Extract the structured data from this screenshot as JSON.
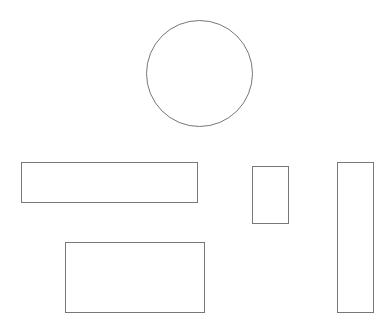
{
  "canvas": {
    "width": 391,
    "height": 330,
    "background": "#ffffff"
  },
  "stroke_color": "#777777",
  "shapes": [
    {
      "id": "circle",
      "type": "circle",
      "x": 146,
      "y": 20,
      "w": 107,
      "h": 107
    },
    {
      "id": "rect-wide",
      "type": "rect",
      "x": 21,
      "y": 162,
      "w": 177,
      "h": 41
    },
    {
      "id": "rect-small",
      "type": "rect",
      "x": 252,
      "y": 166,
      "w": 37,
      "h": 58
    },
    {
      "id": "rect-tall",
      "type": "rect",
      "x": 337,
      "y": 162,
      "w": 37,
      "h": 151
    },
    {
      "id": "rect-bottom",
      "type": "rect",
      "x": 65,
      "y": 242,
      "w": 140,
      "h": 71
    }
  ]
}
